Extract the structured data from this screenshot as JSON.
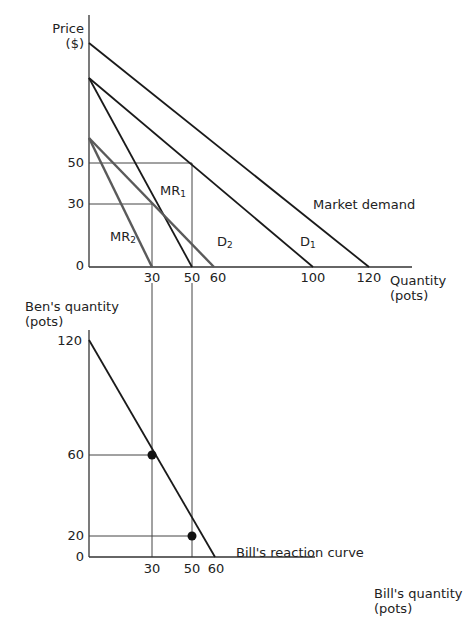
{
  "top_chart": {
    "y_axis_label_line1": "Price",
    "y_axis_label_line2": "($)",
    "x_axis_label_line1": "Quantity",
    "x_axis_label_line2": "(pots)",
    "y_ticks": [
      "50",
      "30",
      "0"
    ],
    "x_ticks": [
      "30",
      "50",
      "60",
      "100",
      "120"
    ],
    "curves": {
      "market_demand": "Market demand",
      "d1_main": "D",
      "d1_sub": "1",
      "d2_main": "D",
      "d2_sub": "2",
      "mr1_main": "MR",
      "mr1_sub": "1",
      "mr2_main": "MR",
      "mr2_sub": "2"
    }
  },
  "bottom_chart": {
    "y_axis_label_line1": "Ben's quantity",
    "y_axis_label_line2": "(pots)",
    "x_axis_label_line1": "Bill's quantity",
    "x_axis_label_line2": "(pots)",
    "y_ticks": [
      "120",
      "60",
      "20",
      "0"
    ],
    "x_ticks": [
      "30",
      "50",
      "60"
    ],
    "curve_label": "Bill's reaction curve"
  },
  "colors": {
    "black_line": "#1a1a1a",
    "gray_line": "#5a5a5a",
    "guide_line": "#444444"
  }
}
